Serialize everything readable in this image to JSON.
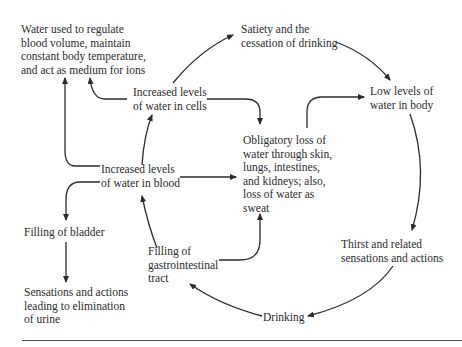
{
  "diagram": {
    "nodes": {
      "water_used": {
        "text": "Water used to regulate\nblood volume, maintain\nconstant body temperature,\nand act as medium for ions"
      },
      "satiety": {
        "text": "Satiety and the\ncessation of drinking"
      },
      "low_levels": {
        "text": "Low levels of\nwater in body"
      },
      "cells": {
        "text": "Increased levels\nof water in cells"
      },
      "obligatory_loss": {
        "text": "Obligatory loss of\nwater through skin,\nlungs, intestines,\nand kidneys; also,\nloss of water as\nsweat"
      },
      "blood": {
        "text": "Increased levels\nof water in blood"
      },
      "bladder": {
        "text": "Filling of bladder"
      },
      "gi_tract": {
        "text": "Filling of\ngastrointestinal\ntract"
      },
      "thirst": {
        "text": "Thirst and related\nsensations and actions"
      },
      "urine": {
        "text": "Sensations and actions\nleading to elimination\nof urine"
      },
      "drinking": {
        "text": "Drinking"
      }
    },
    "edges": [
      {
        "from": "cells",
        "to": "satiety"
      },
      {
        "from": "satiety",
        "to": "low_levels"
      },
      {
        "from": "low_levels",
        "to": "thirst"
      },
      {
        "from": "thirst",
        "to": "drinking"
      },
      {
        "from": "drinking",
        "to": "gi_tract"
      },
      {
        "from": "gi_tract",
        "to": "blood"
      },
      {
        "from": "gi_tract",
        "to": "obligatory_loss"
      },
      {
        "from": "blood",
        "to": "cells"
      },
      {
        "from": "blood",
        "to": "obligatory_loss"
      },
      {
        "from": "blood",
        "to": "water_used"
      },
      {
        "from": "blood",
        "to": "bladder"
      },
      {
        "from": "cells",
        "to": "water_used"
      },
      {
        "from": "cells",
        "to": "obligatory_loss"
      },
      {
        "from": "obligatory_loss",
        "to": "low_levels"
      },
      {
        "from": "bladder",
        "to": "urine"
      }
    ],
    "colors": {
      "ink": "#2b2b2b",
      "background": "#ffffff"
    }
  }
}
